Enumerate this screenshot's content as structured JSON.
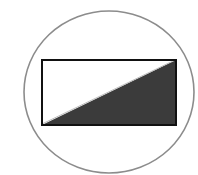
{
  "figure": {
    "description": "Rectangle divided by its diagonal, lower-right triangle shaded, enclosed in a circle",
    "colors": {
      "background": "#ffffff",
      "circle_stroke": "#8c8c8c",
      "rect_stroke": "#111111",
      "rect_fill": "#ffffff",
      "triangle_fill": "#3b3b3b",
      "diagonal_highlight": "#bdbdbd"
    },
    "circle": {
      "cx": 109,
      "cy": 92,
      "rx": 85,
      "ry": 81,
      "stroke_width": 1.6
    },
    "rectangle": {
      "x": 42,
      "y": 60,
      "width": 134,
      "height": 65,
      "stroke_width": 2
    },
    "shaded_triangle": {
      "points": [
        [
          42,
          125
        ],
        [
          176,
          60
        ],
        [
          176,
          125
        ]
      ]
    }
  }
}
